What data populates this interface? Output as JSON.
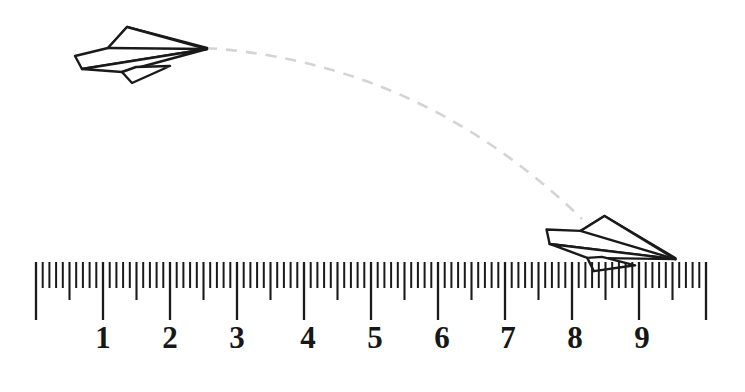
{
  "scene": {
    "title": "paper-airplane-flight-distance-measurement",
    "background_color": "#ffffff",
    "width": 745,
    "height": 392
  },
  "ruler": {
    "name": "measuring-ruler",
    "origin_x": 36,
    "unit_px": 67,
    "baseline_y": 262,
    "minor_tick_length": 26,
    "mid_tick_length": 38,
    "major_tick_length": 58,
    "minor_per_unit": 10,
    "units_total": 10,
    "tick_color": "#1a1a1a",
    "labels": [
      {
        "value": "1",
        "unit": 1,
        "x": 103
      },
      {
        "value": "2",
        "unit": 2,
        "x": 170
      },
      {
        "value": "3",
        "unit": 3,
        "x": 237
      },
      {
        "value": "4",
        "unit": 4,
        "x": 308
      },
      {
        "value": "5",
        "unit": 5,
        "x": 375
      },
      {
        "value": "6",
        "unit": 6,
        "x": 442
      },
      {
        "value": "7",
        "unit": 7,
        "x": 508
      },
      {
        "value": "8",
        "unit": 8,
        "x": 575
      },
      {
        "value": "9",
        "unit": 9,
        "x": 642
      }
    ],
    "label_y": 322
  },
  "trajectory": {
    "name": "flight-path-curve",
    "style": "dashed",
    "color": "#d4d4d4",
    "stroke_width": 2.6,
    "dash_pattern": "11 9",
    "start_x": 206,
    "start_y": 48,
    "end_x": 582,
    "end_y": 219,
    "control_x": 420,
    "control_y": 62
  },
  "airplanes": [
    {
      "name": "paper-airplane-launch",
      "label": "launch position",
      "stroke_color": "#1a1a1a",
      "fill_color": "#ffffff",
      "rotation_deg": 0,
      "anchor_x": 72,
      "anchor_y": 22,
      "nose_x": 207,
      "nose_y": 48
    },
    {
      "name": "paper-airplane-landing",
      "label": "landing position",
      "stroke_color": "#1a1a1a",
      "fill_color": "#ffffff",
      "rotation_deg": 16,
      "anchor_x": 553,
      "anchor_y": 196,
      "nose_x": 692,
      "nose_y": 263
    }
  ],
  "measurement": {
    "name": "flight-distance-reading",
    "landing_mark_unit": "9.8",
    "ruler_range": "0 to 10"
  }
}
